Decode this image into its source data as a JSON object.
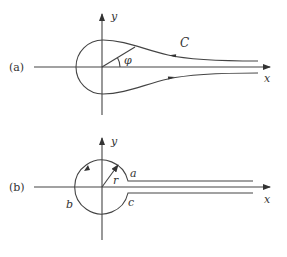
{
  "panels": [
    {
      "id": "a",
      "label": "(a)",
      "axes": {
        "x_label": "x",
        "y_label": "y"
      },
      "contour_label": "C",
      "angle_label": "φ",
      "description": "Teardrop-shaped keyhole contour C around origin, extending along positive x-axis; upper branch arrow points left, lower branch arrow points right"
    },
    {
      "id": "b",
      "label": "(b)",
      "axes": {
        "x_label": "x",
        "y_label": "y"
      },
      "radius_label": "r",
      "point_labels": {
        "a": "a",
        "b": "b",
        "c": "c"
      },
      "description": "Keyhole contour: circle of radius r around origin with straight channel along positive x-axis; arrow counterclockwise on circle"
    }
  ]
}
